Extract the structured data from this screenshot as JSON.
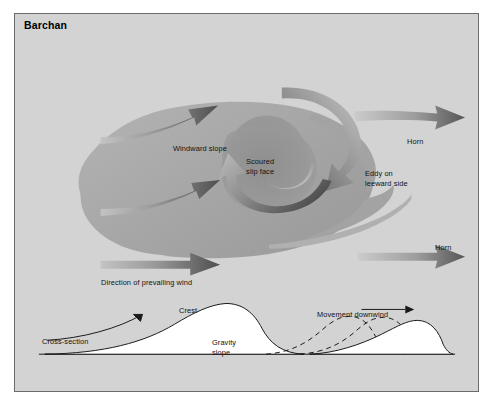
{
  "figure": {
    "title": "Barchan",
    "panel_bg": "#d3d3d3",
    "border_color": "#6b6b6b",
    "dune_fill": "#a8a8a8",
    "slipface_fill": "#9a9a9a",
    "arrow_dark": "#5e5e5e",
    "arrow_light": "#bdbdbd",
    "line_color": "#1a1a1a",
    "cross_section_fill": "#ffffff"
  },
  "labels": {
    "windward_slope": "Windward slope",
    "scoured_slip_face": "Scoured\nslip face",
    "eddy_leeward": "Eddy on\nleeward side",
    "horn_upper": "Horn",
    "horn_lower": "Horn",
    "prevailing_wind": "Direction of prevailing wind",
    "crest": "Crest",
    "gravity_slope": "Gravity\nslope",
    "cross_section": "Cross-section",
    "movement_downwind": "Movement downwind"
  },
  "plan_view": {
    "description": "Plan view of a barchan (crescentic) sand dune with prevailing wind from the left, windward slope, scoured slip face, two downwind horns and an eddy on the leeward side.",
    "wind_arrows": [
      {
        "name": "upper-wind-arrow",
        "from_x": 95,
        "from_y": 115,
        "to_x": 210,
        "to_y": 88
      },
      {
        "name": "middle-wind-arrow",
        "from_x": 95,
        "from_y": 188,
        "to_x": 205,
        "to_y": 167
      },
      {
        "name": "lower-wind-arrow",
        "from_x": 95,
        "from_y": 253,
        "to_x": 205,
        "to_y": 250
      },
      {
        "name": "upper-horn-outflow-arrow",
        "from_x": 370,
        "from_y": 107,
        "to_x": 462,
        "to_y": 104
      },
      {
        "name": "lower-horn-outflow-arrow",
        "from_x": 370,
        "from_y": 250,
        "to_x": 462,
        "to_y": 248
      }
    ],
    "eddy_name": "leeward-eddy-spiral"
  },
  "cross_section": {
    "description": "Profile of the dune showing gentle windward slope, crest and steep gravity (slip) slope, plus successive dashed outlines showing downwind migration.",
    "baseline_y": 372,
    "profiles": [
      {
        "name": "current-profile",
        "style": "solid"
      },
      {
        "name": "earlier-profile-1",
        "style": "dashed"
      },
      {
        "name": "earlier-profile-2",
        "style": "dashed"
      },
      {
        "name": "later-profile",
        "style": "solid"
      }
    ]
  }
}
